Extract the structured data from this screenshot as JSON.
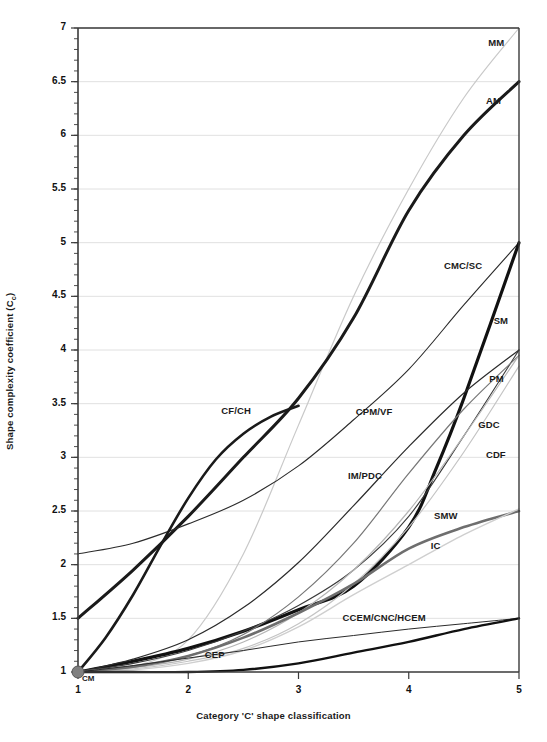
{
  "chart_data": {
    "type": "line",
    "title": "",
    "xlabel": "Category 'C' shape classification",
    "ylabel": "Shape complexity coefficient (Cc)",
    "ylabel_plain": "Shape complexity coefficient (C",
    "ylabel_sub": "c",
    "ylabel_tail": ")",
    "xlim": [
      1,
      5
    ],
    "ylim": [
      1,
      7
    ],
    "grid": true,
    "grid_axis": "y",
    "legend_position": "inline-end-labels",
    "xticks": [
      1,
      2,
      3,
      4,
      5
    ],
    "xtick_labels": [
      "1",
      "2",
      "3",
      "4",
      "5"
    ],
    "yticks": [
      1,
      1.5,
      2,
      2.5,
      3,
      3.5,
      4,
      4.5,
      5,
      5.5,
      6,
      6.5,
      7
    ],
    "ytick_labels": [
      "1",
      "1.5",
      "2",
      "2.5",
      "3",
      "3.5",
      "4",
      "4.5",
      "5",
      "5.5",
      "6",
      "6.5",
      "7"
    ],
    "minor_ticks_y": true,
    "origin_marker": {
      "label": "CM",
      "x": 1,
      "y": 1,
      "color": "#808080",
      "shape": "circle"
    },
    "series": [
      {
        "name": "MM",
        "label": "MM",
        "color": "#c9c9c9",
        "width": 1.2,
        "x": [
          1,
          1.5,
          2,
          2.5,
          3,
          3.5,
          4,
          4.5,
          5
        ],
        "values": [
          1.0,
          1.05,
          1.3,
          2.1,
          3.3,
          4.5,
          5.5,
          6.35,
          7.0
        ]
      },
      {
        "name": "AM",
        "label": "AM",
        "color": "#1a1a1a",
        "width": 3.0,
        "x": [
          1,
          1.5,
          2,
          2.5,
          3,
          3.5,
          4,
          4.5,
          5
        ],
        "values": [
          1.5,
          1.95,
          2.45,
          3.0,
          3.55,
          4.3,
          5.3,
          6.0,
          6.5
        ]
      },
      {
        "name": "CMC/SC",
        "label": "CMC/SC",
        "color": "#2b2b2b",
        "width": 1.1,
        "x": [
          1,
          1.5,
          2,
          2.5,
          3,
          3.5,
          4,
          4.5,
          5
        ],
        "values": [
          2.1,
          2.2,
          2.38,
          2.6,
          2.92,
          3.35,
          3.82,
          4.42,
          5.0
        ]
      },
      {
        "name": "SM",
        "label": "SM",
        "color": "#111111",
        "width": 3.2,
        "x": [
          1,
          1.5,
          2,
          2.5,
          3,
          3.5,
          4,
          4.25,
          4.5,
          5
        ],
        "values": [
          1.0,
          1.1,
          1.22,
          1.38,
          1.58,
          1.8,
          2.35,
          2.9,
          3.55,
          5.0
        ]
      },
      {
        "name": "PM",
        "label": "PM",
        "color": "#3a3a3a",
        "width": 1.1,
        "x": [
          1,
          1.5,
          2,
          2.5,
          3,
          3.5,
          4,
          4.5,
          5
        ],
        "values": [
          1.0,
          1.08,
          1.2,
          1.38,
          1.62,
          1.95,
          2.45,
          3.2,
          4.0
        ]
      },
      {
        "name": "CPM/VF",
        "label": "CPM/VF",
        "color": "#2b2b2b",
        "width": 1.2,
        "x": [
          1,
          1.5,
          2,
          2.5,
          3,
          3.5,
          4,
          4.5,
          5
        ],
        "values": [
          1.0,
          1.12,
          1.3,
          1.6,
          2.02,
          2.55,
          3.1,
          3.6,
          4.0
        ]
      },
      {
        "name": "IM/PDC",
        "label": "IM/PDC",
        "color": "#777777",
        "width": 1.2,
        "x": [
          1,
          1.5,
          2,
          2.5,
          3,
          3.5,
          4,
          4.5,
          5
        ],
        "values": [
          1.0,
          1.05,
          1.15,
          1.35,
          1.7,
          2.2,
          2.85,
          3.45,
          3.95
        ]
      },
      {
        "name": "GDC",
        "label": "GDC",
        "color": "#b5b5b5",
        "width": 1.2,
        "x": [
          1,
          1.5,
          2,
          2.5,
          3,
          3.5,
          4,
          4.5,
          5
        ],
        "values": [
          1.0,
          1.04,
          1.12,
          1.28,
          1.55,
          1.95,
          2.5,
          3.2,
          3.95
        ]
      },
      {
        "name": "CDF",
        "label": "CDF",
        "color": "#c4c4c4",
        "width": 1.2,
        "x": [
          1,
          1.5,
          2,
          2.5,
          3,
          3.5,
          4,
          4.5,
          5
        ],
        "values": [
          1.0,
          1.03,
          1.1,
          1.22,
          1.45,
          1.82,
          2.35,
          3.05,
          3.85
        ]
      },
      {
        "name": "CF/CH",
        "label": "CF/CH",
        "color": "#1a1a1a",
        "width": 2.6,
        "x": [
          1,
          1.25,
          1.5,
          1.75,
          2,
          2.25,
          2.5,
          2.75,
          3
        ],
        "values": [
          1.0,
          1.32,
          1.72,
          2.18,
          2.62,
          2.98,
          3.22,
          3.38,
          3.48
        ]
      },
      {
        "name": "SMW",
        "label": "SMW",
        "color": "#6e6e6e",
        "width": 2.6,
        "x": [
          1,
          1.5,
          2,
          2.5,
          3,
          3.5,
          4,
          4.5,
          5
        ],
        "values": [
          1.0,
          1.05,
          1.15,
          1.32,
          1.55,
          1.82,
          2.15,
          2.35,
          2.5
        ]
      },
      {
        "name": "IC",
        "label": "IC",
        "color": "#cfcfcf",
        "width": 1.4,
        "x": [
          1,
          1.5,
          2,
          2.5,
          3,
          3.5,
          4,
          4.5,
          5
        ],
        "values": [
          1.0,
          1.02,
          1.08,
          1.2,
          1.42,
          1.72,
          2.0,
          2.28,
          2.52
        ]
      },
      {
        "name": "CEP",
        "label": "CEP",
        "color": "#2b2b2b",
        "width": 1.0,
        "x": [
          1,
          1.5,
          2,
          2.5,
          3,
          3.5,
          4,
          4.5,
          5
        ],
        "values": [
          1.0,
          1.06,
          1.13,
          1.2,
          1.28,
          1.34,
          1.4,
          1.45,
          1.5
        ]
      },
      {
        "name": "CCEM/CNC/HCEM",
        "label": "CCEM/CNC/HCEM",
        "color": "#111111",
        "width": 2.4,
        "x": [
          1,
          1.5,
          2,
          2.5,
          3,
          3.5,
          4,
          4.5,
          5
        ],
        "values": [
          1.0,
          1.0,
          1.0,
          1.02,
          1.08,
          1.18,
          1.28,
          1.4,
          1.5
        ]
      }
    ],
    "series_label_positions": [
      {
        "name": "MM",
        "label": "MM",
        "x": 4.72,
        "y": 6.86
      },
      {
        "name": "AM",
        "label": "AM",
        "x": 4.7,
        "y": 6.32
      },
      {
        "name": "CMC/SC",
        "label": "CMC/SC",
        "x": 4.32,
        "y": 4.78
      },
      {
        "name": "SM",
        "label": "SM",
        "x": 4.77,
        "y": 4.27
      },
      {
        "name": "PM",
        "label": "PM",
        "x": 4.73,
        "y": 3.73
      },
      {
        "name": "GDC",
        "label": "GDC",
        "x": 4.63,
        "y": 3.3
      },
      {
        "name": "CDF",
        "label": "CDF",
        "x": 4.7,
        "y": 3.02
      },
      {
        "name": "CPM/VF",
        "label": "CPM/VF",
        "x": 3.52,
        "y": 3.42
      },
      {
        "name": "IM/PDC",
        "label": "IM/PDC",
        "x": 3.45,
        "y": 2.83
      },
      {
        "name": "SMW",
        "label": "SMW",
        "x": 4.23,
        "y": 2.45
      },
      {
        "name": "IC",
        "label": "IC",
        "x": 4.2,
        "y": 2.17
      },
      {
        "name": "CF/CH",
        "label": "CF/CH",
        "x": 2.3,
        "y": 3.43
      },
      {
        "name": "CEP",
        "label": "CEP",
        "x": 2.15,
        "y": 1.16
      },
      {
        "name": "CCEM/CNC/HCEM",
        "label": "CCEM/CNC/HCEM",
        "x": 3.4,
        "y": 1.5
      }
    ]
  },
  "colors": {
    "axis": "#3a3a3a",
    "grid": "#d8d8d8",
    "text": "#111111",
    "background": "#ffffff"
  }
}
